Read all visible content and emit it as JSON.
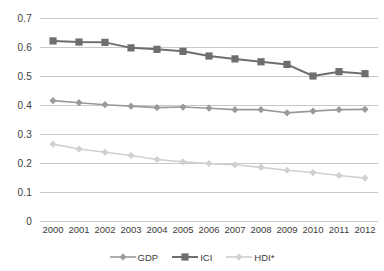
{
  "chart_data": {
    "type": "line",
    "title": "",
    "subtitle": "",
    "xlabel": "",
    "ylabel": "",
    "categories": [
      "2000",
      "2001",
      "2002",
      "2003",
      "2004",
      "2005",
      "2006",
      "2007",
      "2008",
      "2009",
      "2010",
      "2011",
      "2012"
    ],
    "ylim": [
      0,
      0.7
    ],
    "ytick_labels": [
      "0.7",
      "0.6",
      "0.5",
      "0.4",
      "0.3",
      "0.2",
      "0.1",
      "0"
    ],
    "ytick_values": [
      0.7,
      0.6,
      0.5,
      0.4,
      0.3,
      0.2,
      0.1,
      0
    ],
    "grid": true,
    "grid_axis": "y",
    "legend_position": "bottom",
    "series": [
      {
        "name": "GDP",
        "marker": "diamond",
        "color": "#9a9a9a",
        "values": [
          0.415,
          0.408,
          0.401,
          0.396,
          0.391,
          0.393,
          0.389,
          0.384,
          0.384,
          0.373,
          0.379,
          0.384,
          0.385
        ]
      },
      {
        "name": "ICI",
        "marker": "square",
        "color": "#6e6e6e",
        "values": [
          0.621,
          0.617,
          0.616,
          0.597,
          0.592,
          0.585,
          0.569,
          0.559,
          0.549,
          0.54,
          0.5,
          0.515,
          0.508
        ]
      },
      {
        "name": "HDI*",
        "marker": "diamond",
        "color": "#d0d0d0",
        "values": [
          0.265,
          0.248,
          0.237,
          0.226,
          0.212,
          0.204,
          0.198,
          0.194,
          0.185,
          0.175,
          0.167,
          0.157,
          0.148
        ]
      }
    ]
  },
  "legend": {
    "items": [
      {
        "label": "GDP"
      },
      {
        "label": "ICI"
      },
      {
        "label": "HDI*"
      }
    ]
  },
  "colors": {
    "gridline": "#c8c8c8",
    "text": "#3c3c3c",
    "background": "#ffffff",
    "series_gdp": "#9a9a9a",
    "series_ici": "#6e6e6e",
    "series_hdi": "#d0d0d0"
  }
}
